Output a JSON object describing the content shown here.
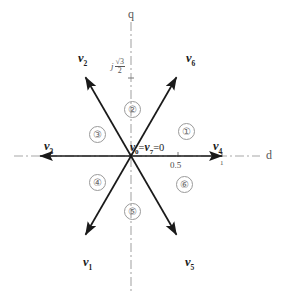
{
  "figure": {
    "name": "space-vector-hexagon-diagram",
    "origin": {
      "x": 131,
      "y": 156
    },
    "colors": {
      "vector": "#1a1a1a",
      "axis": "#9a9a9a",
      "sector_text": "#6a6a6a",
      "background": "#ffffff"
    }
  },
  "axes": {
    "vertical": {
      "label": "q",
      "label_x": 128,
      "label_y": 8
    },
    "horizontal": {
      "label": "d",
      "label_x": 266,
      "label_y": 149
    }
  },
  "ticks": [
    {
      "name": "tick-half",
      "value": "0.5",
      "x": 172,
      "y": 166
    },
    {
      "name": "tick-one",
      "value": "1",
      "x": 219,
      "y": 162
    },
    {
      "name": "tick-j-sqrt3-over-2",
      "j": "j",
      "numerator": "√3",
      "denominator": "2",
      "x": 112,
      "y": 56
    }
  ],
  "zero_vector": {
    "name": "zero-vector-label",
    "v_left": "v",
    "sub_left": "0",
    "equals_1": "=",
    "v_right": "v",
    "sub_right": "7",
    "equals_2": "=",
    "value": "0",
    "x": 130,
    "y": 142
  },
  "vectors": [
    {
      "id": "v1",
      "label": "v",
      "subscript": "1",
      "angle_deg": 240,
      "label_x": 83,
      "label_y": 256
    },
    {
      "id": "v2",
      "label": "v",
      "subscript": "2",
      "angle_deg": 120,
      "label_x": 78,
      "label_y": 52
    },
    {
      "id": "v3",
      "label": "v",
      "subscript": "3",
      "angle_deg": 180,
      "label_x": 44,
      "label_y": 140
    },
    {
      "id": "v4",
      "label": "v",
      "subscript": "4",
      "angle_deg": 0,
      "label_x": 213,
      "label_y": 140
    },
    {
      "id": "v5",
      "label": "v",
      "subscript": "5",
      "angle_deg": 300,
      "label_x": 185,
      "label_y": 256
    },
    {
      "id": "v6",
      "label": "v",
      "subscript": "6",
      "angle_deg": 60,
      "label_x": 186,
      "label_y": 52
    }
  ],
  "sectors": [
    {
      "id": "sector-1",
      "label": "①",
      "x": 178,
      "y": 123
    },
    {
      "id": "sector-2",
      "label": "②",
      "x": 124,
      "y": 101
    },
    {
      "id": "sector-3",
      "label": "③",
      "x": 89,
      "y": 126
    },
    {
      "id": "sector-4",
      "label": "④",
      "x": 89,
      "y": 174
    },
    {
      "id": "sector-5",
      "label": "⑤",
      "x": 131,
      "y": 203
    },
    {
      "id": "sector-6",
      "label": "⑥",
      "x": 176,
      "y": 176
    }
  ]
}
